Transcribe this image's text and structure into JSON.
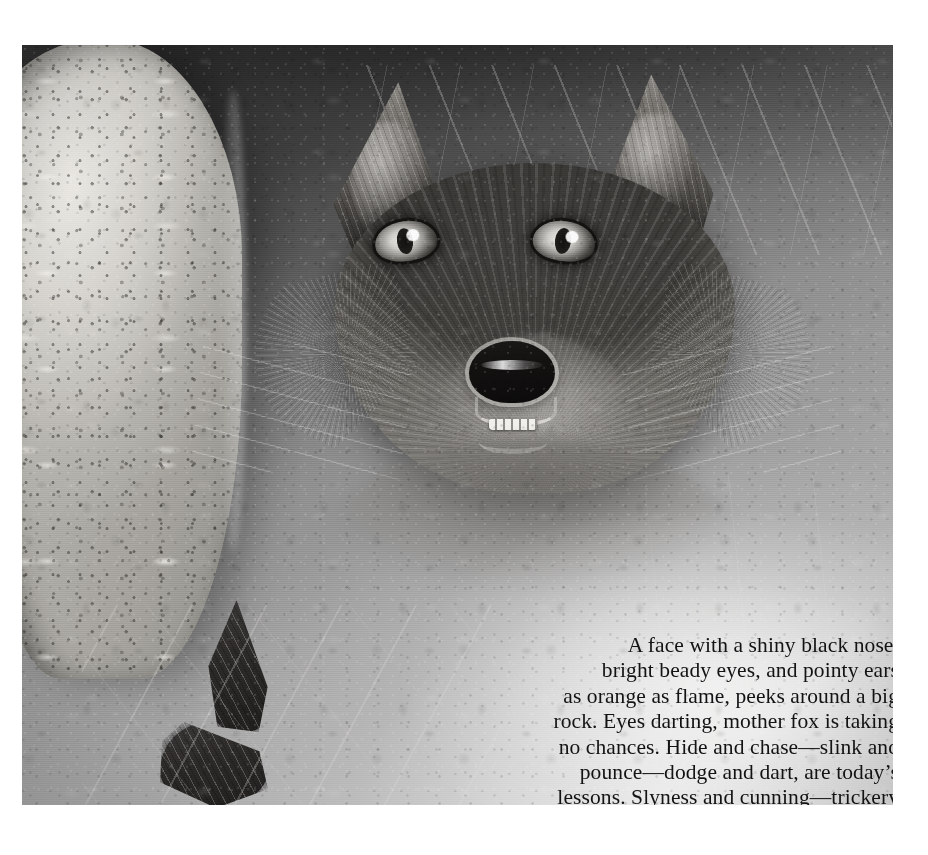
{
  "page": {
    "kind": "picture-book-page",
    "background_color": "#ffffff",
    "width": 928,
    "height": 855
  },
  "illustration": {
    "name": "fox-illustration",
    "description": "Grayscale painted illustration of a red fox peering around a large pale rock, surrounded by grass.",
    "medium": "grayscale halftone print reproduction",
    "bounds": {
      "left": 22,
      "top": 45,
      "width": 871,
      "height": 760
    },
    "palette": {
      "deep_shadow": "#1a1a1a",
      "dark_canopy": "#2e2e2e",
      "midtone": "#8a8a8a",
      "light_ground": "#c8c8c8",
      "rock_highlight": "#dad8d2",
      "paper_white": "#ffffff",
      "text_ink": "#131313"
    },
    "subjects": [
      {
        "name": "fox-head",
        "label": "fox head"
      },
      {
        "name": "fox-ear-left",
        "label": "left ear"
      },
      {
        "name": "fox-ear-right",
        "label": "right ear"
      },
      {
        "name": "fox-eye-left",
        "label": "left eye"
      },
      {
        "name": "fox-eye-right",
        "label": "right eye"
      },
      {
        "name": "fox-nose",
        "label": "shiny black nose"
      },
      {
        "name": "fox-mouth",
        "label": "open mouth with teeth"
      },
      {
        "name": "rock",
        "label": "big pale rock"
      },
      {
        "name": "fox-paws",
        "label": "fox paws"
      },
      {
        "name": "grass",
        "label": "grass blades"
      }
    ]
  },
  "caption": {
    "name": "story-caption",
    "alignment": "right",
    "text": "A face with a shiny black nose,\nbright beady eyes, and pointy ears\nas orange as flame, peeks around a big\nrock. Eyes darting, mother fox is taking\nno chances. Hide and chase—slink and\npounce—dodge and dart, are today’s\nlessons. Slyness and cunning—trickery\nand winning,  will keep her babies alive.",
    "lines": [
      "A face with a shiny black nose,",
      "bright beady eyes, and pointy ears",
      "as orange as flame, peeks around a big",
      "rock. Eyes darting, mother fox is taking",
      "no chances. Hide and chase—slink and",
      "pounce—dodge and dart, are today’s",
      "lessons. Slyness and cunning—trickery",
      "and winning,  will keep her babies alive."
    ]
  }
}
